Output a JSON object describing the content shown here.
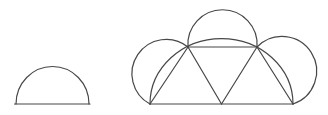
{
  "diagram": {
    "background": "#ffffff",
    "stroke": "#474747",
    "stroke_width": 1.2,
    "width": 328,
    "height": 115,
    "elements": [
      {
        "name": "small-semicircle-baseline",
        "type": "line",
        "x1": 14.5,
        "y1": 104,
        "x2": 90,
        "y2": 104
      },
      {
        "name": "small-semicircle-arc",
        "type": "path",
        "d": "M 16 104 A 36.5 37.5 0 0 1 89 104"
      },
      {
        "name": "net-baseline",
        "type": "line",
        "x1": 150,
        "y1": 104,
        "x2": 293,
        "y2": 104
      },
      {
        "name": "net-top-edge",
        "type": "line",
        "x1": 188,
        "y1": 47,
        "x2": 257,
        "y2": 47
      },
      {
        "name": "net-left-slant-edge",
        "type": "line",
        "x1": 150,
        "y1": 104,
        "x2": 188,
        "y2": 47
      },
      {
        "name": "net-left-inner-edge",
        "type": "line",
        "x1": 188,
        "y1": 47,
        "x2": 221.5,
        "y2": 104
      },
      {
        "name": "net-right-inner-edge",
        "type": "line",
        "x1": 221.5,
        "y1": 104,
        "x2": 257,
        "y2": 47
      },
      {
        "name": "net-right-slant-edge",
        "type": "line",
        "x1": 257,
        "y1": 47,
        "x2": 293,
        "y2": 104
      },
      {
        "name": "net-left-semicircle-arc",
        "type": "path",
        "d": "M 150 104 A 34.4 34.4 0 1 1 188 47"
      },
      {
        "name": "net-top-semicircle-arc",
        "type": "path",
        "d": "M 188 47 A 34.6 34.6 0 1 1 257 47"
      },
      {
        "name": "net-right-semicircle-arc",
        "type": "path",
        "d": "M 257 47 A 34.7 34.7 0 1 1 293 104"
      },
      {
        "name": "net-large-semicircle-arc",
        "type": "path",
        "d": "M 150 104 A 71.5 65.5 0 0 1 293 104"
      }
    ]
  }
}
